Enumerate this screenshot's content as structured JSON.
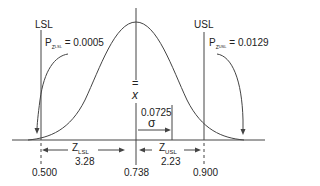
{
  "diagram": {
    "type": "normal-distribution-process-capability",
    "lsl_label": "LSL",
    "usl_label": "USL",
    "p_lsl": {
      "symbol": "P",
      "subscript": "Z",
      "subsubscript": "LSL",
      "value_text": "= 0.0005"
    },
    "p_usl": {
      "symbol": "P",
      "subscript": "Z",
      "subsubscript": "USL",
      "value_text": "= 0.0129"
    },
    "mean_symbol": "x",
    "mean_bar": "=",
    "sigma_value": "0.0725",
    "sigma_symbol": "σ",
    "z_lsl": {
      "symbol": "Z",
      "subscript": "LSL",
      "value": "3.28"
    },
    "z_usl": {
      "symbol": "Z",
      "subscript": "USL",
      "value": "2.23"
    },
    "axis_ticks": [
      "0.500",
      "0.738",
      "0.900"
    ],
    "colors": {
      "line": "#333333",
      "background": "#ffffff"
    }
  }
}
